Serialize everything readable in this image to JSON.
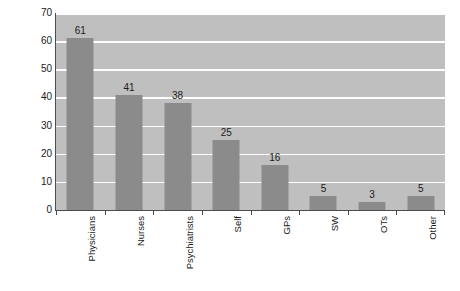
{
  "chart_data": {
    "type": "bar",
    "title": "",
    "subtitle": "",
    "xlabel": "",
    "ylabel": "Number of respondents",
    "categories": [
      "Physicians",
      "Nurses",
      "Psychiatrists",
      "Self",
      "GPs",
      "SW",
      "OTs",
      "Other"
    ],
    "values": [
      61,
      41,
      38,
      25,
      16,
      5,
      3,
      5
    ],
    "value_labels": [
      "61",
      "41",
      "38",
      "25",
      "16",
      "5",
      "3",
      "5"
    ],
    "ylim": [
      0,
      70
    ],
    "y_ticks": [
      0,
      10,
      20,
      30,
      40,
      50,
      60,
      70
    ],
    "y_tick_labels": [
      "0",
      "10",
      "20",
      "30",
      "40",
      "50",
      "60",
      "70"
    ],
    "grid": "horizontal",
    "legend": "none",
    "orientation": "vertical",
    "colors": {
      "bar": "#8b8b8b",
      "plot_background": "#bfbfbf",
      "gridline": "#ffffff",
      "axis": "#4d4d4d",
      "text": "#1a1a1a",
      "figure_background": "#ffffff"
    }
  }
}
